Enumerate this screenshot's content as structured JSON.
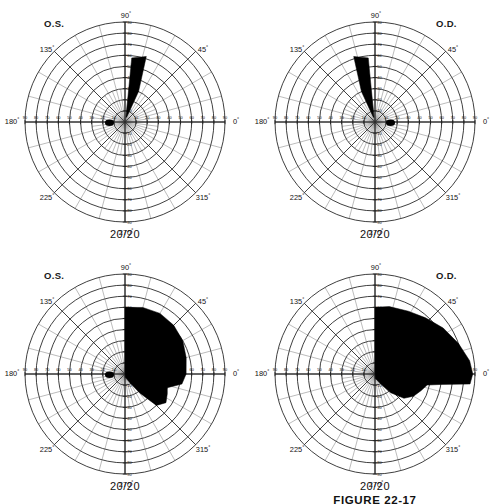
{
  "figure": {
    "caption": "FIGURE 22-17",
    "panel_count": 4
  },
  "charts": [
    {
      "id": "top-left",
      "eye_label": "O.S.",
      "eye_label_position": "left",
      "acuity": "20/20",
      "meridian_labels": [
        "0",
        "45",
        "90",
        "135",
        "180",
        "225",
        "270",
        "315"
      ],
      "degree_symbol": "°",
      "radial_ticks": [
        10,
        20,
        30,
        40,
        50,
        60,
        70,
        80,
        90
      ],
      "chart_data": {
        "type": "area",
        "title": "Goldmann visual field O.S.",
        "coordinate_system": "polar",
        "radial_axis_label": "degrees of eccentricity",
        "radial_range": [
          0,
          90
        ],
        "radial_tick_interval": 10,
        "angular_tick_interval": 15,
        "angular_major_interval": 45,
        "grid": true,
        "legend": "none",
        "series": [
          {
            "name": "field defect (scotoma)",
            "fill": "#000000",
            "kind": "superior-wedge",
            "polar_points": [
              [
                78,
                4
              ],
              [
                84,
                58
              ],
              [
                72,
                62
              ],
              [
                66,
                30
              ],
              [
                70,
                5
              ]
            ]
          },
          {
            "name": "physiologic blind spot",
            "fill": "#000000",
            "kind": "blind-spot",
            "center_polar": [
              183,
              14
            ],
            "radius_x": 4.5,
            "radius_y": 3.2
          }
        ]
      }
    },
    {
      "id": "top-right",
      "eye_label": "O.D.",
      "eye_label_position": "right",
      "acuity": "20/20",
      "meridian_labels": [
        "0",
        "45",
        "90",
        "135",
        "180",
        "225",
        "270",
        "315"
      ],
      "degree_symbol": "°",
      "radial_ticks": [
        10,
        20,
        30,
        40,
        50,
        60,
        70,
        80,
        90
      ],
      "chart_data": {
        "type": "area",
        "title": "Goldmann visual field O.D.",
        "coordinate_system": "polar",
        "radial_axis_label": "degrees of eccentricity",
        "radial_range": [
          0,
          90
        ],
        "radial_tick_interval": 10,
        "angular_tick_interval": 15,
        "angular_major_interval": 45,
        "grid": true,
        "legend": "none",
        "series": [
          {
            "name": "field defect (scotoma)",
            "fill": "#000000",
            "kind": "superior-wedge",
            "polar_points": [
              [
                102,
                4
              ],
              [
                96,
                58
              ],
              [
                108,
                62
              ],
              [
                114,
                30
              ],
              [
                110,
                5
              ]
            ]
          },
          {
            "name": "physiologic blind spot",
            "fill": "#000000",
            "kind": "blind-spot",
            "center_polar": [
              -3,
              14
            ],
            "radius_x": 4.5,
            "radius_y": 3.2
          }
        ]
      }
    },
    {
      "id": "bottom-left",
      "eye_label": "O.S.",
      "eye_label_position": "left",
      "acuity": "20/20",
      "meridian_labels": [
        "0",
        "45",
        "90",
        "135",
        "180",
        "225",
        "270",
        "315"
      ],
      "degree_symbol": "°",
      "radial_ticks": [
        10,
        20,
        30,
        40,
        50,
        60,
        70,
        80,
        90
      ],
      "chart_data": {
        "type": "area",
        "title": "Goldmann visual field O.S. with dense homonymous defect",
        "coordinate_system": "polar",
        "radial_axis_label": "degrees of eccentricity",
        "radial_range": [
          0,
          90
        ],
        "radial_tick_interval": 10,
        "angular_tick_interval": 15,
        "angular_major_interval": 45,
        "grid": true,
        "legend": "none",
        "series": [
          {
            "name": "field defect (scotoma)",
            "fill": "#000000",
            "kind": "hemianopic-right",
            "polar_points": [
              [
                90,
                3
              ],
              [
                90,
                60
              ],
              [
                75,
                62
              ],
              [
                60,
                63
              ],
              [
                45,
                62
              ],
              [
                30,
                60
              ],
              [
                15,
                57
              ],
              [
                0,
                55
              ],
              [
                -10,
                52
              ],
              [
                -18,
                40
              ],
              [
                -25,
                42
              ],
              [
                -35,
                45
              ],
              [
                -45,
                40
              ],
              [
                -52,
                22
              ],
              [
                -60,
                10
              ],
              [
                -70,
                5
              ],
              [
                -85,
                3
              ]
            ]
          },
          {
            "name": "physiologic blind spot",
            "fill": "#000000",
            "kind": "blind-spot",
            "center_polar": [
              183,
              14
            ],
            "radius_x": 4.5,
            "radius_y": 3.2
          }
        ]
      }
    },
    {
      "id": "bottom-right",
      "eye_label": "O.D.",
      "eye_label_position": "right",
      "acuity": "20/20",
      "meridian_labels": [
        "0",
        "45",
        "90",
        "135",
        "180",
        "225",
        "270",
        "315"
      ],
      "degree_symbol": "°",
      "radial_ticks": [
        10,
        20,
        30,
        40,
        50,
        60,
        70,
        80,
        90
      ],
      "chart_data": {
        "type": "area",
        "title": "Goldmann visual field O.D. with dense homonymous defect",
        "coordinate_system": "polar",
        "radial_axis_label": "degrees of eccentricity",
        "radial_range": [
          0,
          90
        ],
        "radial_tick_interval": 10,
        "angular_tick_interval": 15,
        "angular_major_interval": 45,
        "grid": true,
        "legend": "none",
        "series": [
          {
            "name": "field defect (scotoma)",
            "fill": "#000000",
            "kind": "hemianopic-right-wide",
            "polar_points": [
              [
                90,
                3
              ],
              [
                90,
                60
              ],
              [
                78,
                62
              ],
              [
                62,
                64
              ],
              [
                48,
                68
              ],
              [
                34,
                74
              ],
              [
                20,
                80
              ],
              [
                8,
                86
              ],
              [
                0,
                88
              ],
              [
                -6,
                86
              ],
              [
                -9,
                60
              ],
              [
                -12,
                48
              ],
              [
                -20,
                44
              ],
              [
                -30,
                40
              ],
              [
                -40,
                34
              ],
              [
                -50,
                22
              ],
              [
                -58,
                12
              ],
              [
                -72,
                6
              ],
              [
                -86,
                4
              ]
            ]
          }
        ]
      }
    }
  ]
}
